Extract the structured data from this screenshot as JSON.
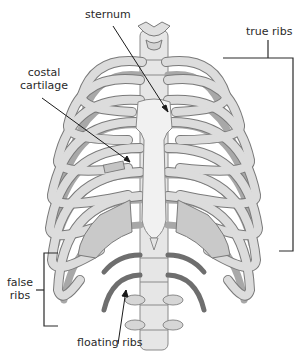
{
  "diagram": {
    "labels": {
      "sternum": "sternum",
      "true_ribs": "true ribs",
      "costal_cartilage_line1": "costal",
      "costal_cartilage_line2": "cartilage",
      "false_ribs_line1": "false",
      "false_ribs_line2": "ribs",
      "floating_ribs": "floating ribs"
    },
    "colors": {
      "bone": "#d9d9d9",
      "bone_light": "#ececec",
      "bone_outline": "#7a7a7a",
      "rib_back": "#a8a8a8",
      "cartilage": "#c4c4c4",
      "floating_rib": "#6e6e6e",
      "sternum": "#f1f1f1",
      "leader_line": "#1a1a1a",
      "text": "#2a2a2a"
    }
  }
}
